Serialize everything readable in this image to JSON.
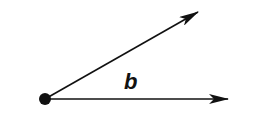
{
  "diagram": {
    "type": "angle",
    "angle_label": "b",
    "vertex": {
      "x": 45,
      "y": 99,
      "r": 6
    },
    "rays": [
      {
        "name": "upper-ray",
        "x1": 45,
        "y1": 99,
        "x2": 198,
        "y2": 12
      },
      {
        "name": "lower-ray",
        "x1": 45,
        "y1": 99,
        "x2": 228,
        "y2": 99
      }
    ],
    "colors": {
      "stroke": "#111111",
      "background": "#ffffff"
    }
  }
}
